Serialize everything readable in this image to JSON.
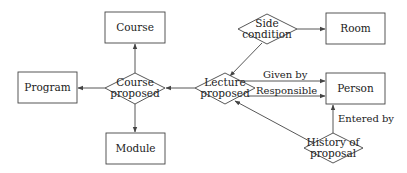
{
  "diagram": {
    "type": "entity-relationship",
    "entities": [
      {
        "id": "course",
        "label": "Course"
      },
      {
        "id": "program",
        "label": "Program"
      },
      {
        "id": "module",
        "label": "Module"
      },
      {
        "id": "room",
        "label": "Room"
      },
      {
        "id": "person",
        "label": "Person"
      }
    ],
    "relationships": [
      {
        "id": "course_proposed",
        "label_line1": "Course",
        "label_line2": "proposed"
      },
      {
        "id": "lecture_proposed",
        "label_line1": "Lecture",
        "label_line2": "proposed"
      },
      {
        "id": "side_condition",
        "label_line1": "Side",
        "label_line2": "condition"
      },
      {
        "id": "history_of_proposal",
        "label_line1": "History of",
        "label_line2": "proposal"
      }
    ],
    "edges": [
      {
        "from": "course_proposed",
        "to": "course",
        "label": ""
      },
      {
        "from": "course_proposed",
        "to": "program",
        "label": ""
      },
      {
        "from": "course_proposed",
        "to": "module",
        "label": ""
      },
      {
        "from": "lecture_proposed",
        "to": "course_proposed",
        "label": ""
      },
      {
        "from": "side_condition",
        "to": "lecture_proposed",
        "label": ""
      },
      {
        "from": "side_condition",
        "to": "room",
        "label": ""
      },
      {
        "from": "lecture_proposed",
        "to": "person",
        "label": "Given by"
      },
      {
        "from": "lecture_proposed",
        "to": "person",
        "label": "Responsible"
      },
      {
        "from": "history_of_proposal",
        "to": "lecture_proposed",
        "label": ""
      },
      {
        "from": "history_of_proposal",
        "to": "person",
        "label": "Entered by"
      }
    ],
    "colors": {
      "stroke": "#444444",
      "text": "#222222",
      "background": "#ffffff"
    }
  }
}
